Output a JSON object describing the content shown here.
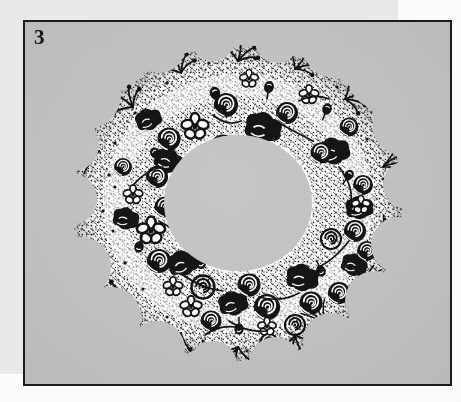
{
  "document": {
    "type": "scanned-book-page",
    "page_background": "#ffffff",
    "paper_margin_color": "#ececed"
  },
  "figure": {
    "number_label": "3",
    "border_color": "#1b1b1b",
    "plate_background": "#c3c3c3",
    "ink_color": "#111111",
    "highlight_color": "#ffffff",
    "caption": "",
    "illustration": {
      "name": "floral-wreath",
      "description": "Pen-and-ink line drawing of a circular floral wreath composed of roses, daisies, small blossoms, buds, leaves and stippled filler foliage, forming an open ring with a hollow center.",
      "style": "black-and-white pen-and-ink line art",
      "shape": "ring",
      "inner_hole_visible": true,
      "motifs": [
        "rose",
        "daisy",
        "small-blossom",
        "bud",
        "leaf-spray",
        "stipple-foliage",
        "grass-blade"
      ]
    }
  }
}
